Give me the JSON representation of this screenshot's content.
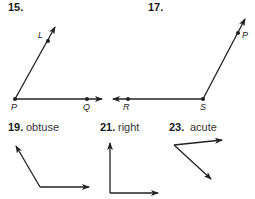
{
  "exercises": [
    {
      "number": "15.",
      "points": {
        "vertex": "P",
        "ray1": "L",
        "ray2": "Q"
      }
    },
    {
      "number": "17.",
      "points": {
        "vertex": "S",
        "ray1": "P",
        "ray2": "R"
      }
    },
    {
      "number": "19.",
      "label": "obtuse"
    },
    {
      "number": "21.",
      "label": "right"
    },
    {
      "number": "23.",
      "label": "acute"
    }
  ],
  "colors": {
    "line": "#222222",
    "text": "#1a1a1a"
  }
}
